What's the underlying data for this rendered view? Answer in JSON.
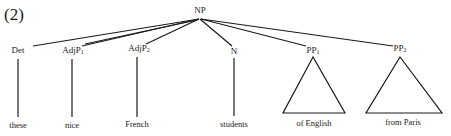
{
  "example_number": "(2)",
  "tree": {
    "root": {
      "label": "NP"
    },
    "children": [
      {
        "label": "Det",
        "sub": "",
        "leaf": "these",
        "type": "line"
      },
      {
        "label": "AdjP",
        "sub": "1",
        "leaf": "nice",
        "type": "line"
      },
      {
        "label": "AdjP",
        "sub": "2",
        "leaf": "French",
        "type": "line"
      },
      {
        "label": "N",
        "sub": "",
        "leaf": "students",
        "type": "line"
      },
      {
        "label": "PP",
        "sub": "1",
        "leaf": "of English",
        "type": "triangle"
      },
      {
        "label": "PP",
        "sub": "2",
        "leaf": "from Paris",
        "type": "triangle"
      }
    ]
  },
  "colors": {
    "ink": "#1a1a1a",
    "background": "#ffffff"
  }
}
